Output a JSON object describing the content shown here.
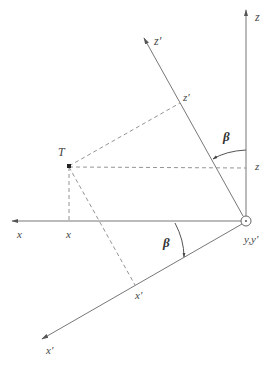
{
  "diagram": {
    "type": "coordinate-rotation",
    "colors": {
      "axis": "#777777",
      "dashed": "#888888",
      "text": "#444444"
    },
    "origin_label": "y,y′",
    "point_label": "T",
    "angle_label": "β",
    "axes": {
      "x": {
        "label": "x"
      },
      "z": {
        "label": "z"
      },
      "x_prime": {
        "label": "x′"
      },
      "z_prime": {
        "label": "z′"
      }
    },
    "projections": {
      "x": "x",
      "z": "z",
      "x_prime": "x′",
      "z_prime": "z′"
    }
  }
}
